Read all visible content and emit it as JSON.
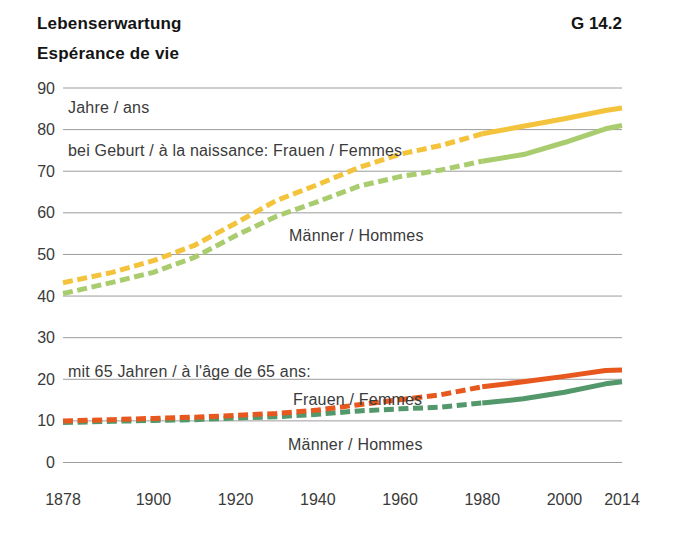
{
  "header": {
    "title_de": "Lebenserwartung",
    "title_fr": "Espérance de vie",
    "figure_code": "G 14.2"
  },
  "colors": {
    "grid": "#9c9c9c",
    "text": "#3a3a3a",
    "title": "#141414",
    "birth_women": "#F4C33C",
    "birth_men": "#A9CD6E",
    "age65_women": "#E8581E",
    "age65_men": "#53986B"
  },
  "chart_data": {
    "type": "line",
    "xlabel": "",
    "ylabel": "Jahre / ans",
    "grid": true,
    "x": {
      "min": 1878,
      "max": 2014,
      "ticks": [
        1878,
        1900,
        1920,
        1940,
        1960,
        1980,
        2000,
        2014
      ]
    },
    "y": {
      "min": 0,
      "max": 90,
      "ticks": [
        0,
        10,
        20,
        30,
        40,
        50,
        60,
        70,
        80,
        90
      ]
    },
    "labels": {
      "unit": "Jahre / ans",
      "birth_women": "bei Geburt / à la naissance: Frauen / Femmes",
      "birth_men": "Männer / Hommes",
      "age65": "mit 65 Jahren / à l'âge de 65 ans:",
      "age65_women": "Frauen / Femmes",
      "age65_men": "Männer / Hommes"
    },
    "series": [
      {
        "name": "bei Geburt – Frauen / Femmes",
        "color_key": "birth_women",
        "color": "#F4C33C",
        "dash_until": 1980,
        "points": [
          [
            1878,
            43.2
          ],
          [
            1890,
            45.7
          ],
          [
            1900,
            48.5
          ],
          [
            1910,
            52.2
          ],
          [
            1920,
            57.5
          ],
          [
            1930,
            63.0
          ],
          [
            1940,
            66.8
          ],
          [
            1950,
            70.9
          ],
          [
            1960,
            74.1
          ],
          [
            1970,
            76.2
          ],
          [
            1980,
            79.0
          ],
          [
            1990,
            80.8
          ],
          [
            2000,
            82.6
          ],
          [
            2010,
            84.6
          ],
          [
            2014,
            85.2
          ]
        ]
      },
      {
        "name": "bei Geburt – Männer / Hommes",
        "color_key": "birth_men",
        "color": "#A9CD6E",
        "dash_until": 1980,
        "points": [
          [
            1878,
            40.6
          ],
          [
            1890,
            43.3
          ],
          [
            1900,
            45.7
          ],
          [
            1910,
            49.3
          ],
          [
            1920,
            54.5
          ],
          [
            1930,
            59.2
          ],
          [
            1940,
            62.7
          ],
          [
            1950,
            66.4
          ],
          [
            1960,
            68.7
          ],
          [
            1970,
            70.3
          ],
          [
            1980,
            72.4
          ],
          [
            1990,
            74.0
          ],
          [
            2000,
            76.9
          ],
          [
            2010,
            80.2
          ],
          [
            2014,
            81.0
          ]
        ]
      },
      {
        "name": "mit 65 Jahren – Männer / Hommes",
        "color_key": "age65_men",
        "color": "#53986B",
        "dash_until": 1980,
        "points": [
          [
            1878,
            9.6
          ],
          [
            1890,
            9.9
          ],
          [
            1900,
            10.1
          ],
          [
            1910,
            10.3
          ],
          [
            1920,
            10.7
          ],
          [
            1930,
            11.0
          ],
          [
            1940,
            11.6
          ],
          [
            1950,
            12.4
          ],
          [
            1960,
            12.9
          ],
          [
            1970,
            13.3
          ],
          [
            1980,
            14.3
          ],
          [
            1990,
            15.3
          ],
          [
            2000,
            16.9
          ],
          [
            2010,
            18.9
          ],
          [
            2014,
            19.4
          ]
        ]
      },
      {
        "name": "mit 65 Jahren – Frauen / Femmes",
        "color_key": "age65_women",
        "color": "#E8581E",
        "dash_until": 1980,
        "points": [
          [
            1878,
            10.0
          ],
          [
            1890,
            10.3
          ],
          [
            1900,
            10.6
          ],
          [
            1910,
            10.9
          ],
          [
            1920,
            11.3
          ],
          [
            1930,
            11.8
          ],
          [
            1940,
            12.6
          ],
          [
            1950,
            13.9
          ],
          [
            1960,
            15.1
          ],
          [
            1970,
            16.3
          ],
          [
            1980,
            18.2
          ],
          [
            1990,
            19.4
          ],
          [
            2000,
            20.7
          ],
          [
            2010,
            22.1
          ],
          [
            2014,
            22.2
          ]
        ]
      }
    ]
  }
}
